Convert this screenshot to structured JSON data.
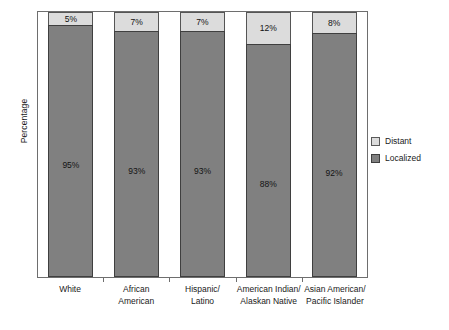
{
  "chart_data": {
    "type": "bar",
    "subtype": "stacked-bar-100",
    "title": "",
    "xlabel": "",
    "ylabel": "Percentage",
    "ylim": [
      0,
      100
    ],
    "grid": false,
    "legend_position": "right",
    "categories": [
      "White",
      "African American",
      "Hispanic/ Latino",
      "American Indian/ Alaskan Native",
      "Asian American/ Pacific Islander"
    ],
    "category_lines": [
      [
        "White"
      ],
      [
        "African",
        "American"
      ],
      [
        "Hispanic/",
        "Latino"
      ],
      [
        "American Indian/",
        "Alaskan Native"
      ],
      [
        "Asian American/",
        "Pacific Islander"
      ]
    ],
    "series": [
      {
        "name": "Distant",
        "color": "#dcdcdc",
        "values": [
          5,
          7,
          7,
          12,
          8
        ],
        "labels": [
          "5%",
          "7%",
          "7%",
          "12%",
          "8%"
        ]
      },
      {
        "name": "Localized",
        "color": "#808080",
        "values": [
          95,
          93,
          93,
          88,
          92
        ],
        "labels": [
          "95%",
          "93%",
          "93%",
          "88%",
          "92%"
        ]
      }
    ],
    "tick_labels_y": [],
    "axis_color": "#6e6e6e"
  },
  "legend": {
    "items": [
      {
        "label": "Distant",
        "swatch": "distant-swatch"
      },
      {
        "label": "Localized",
        "swatch": "localized-swatch"
      }
    ]
  },
  "axes": {
    "y_title": "Percentage"
  }
}
